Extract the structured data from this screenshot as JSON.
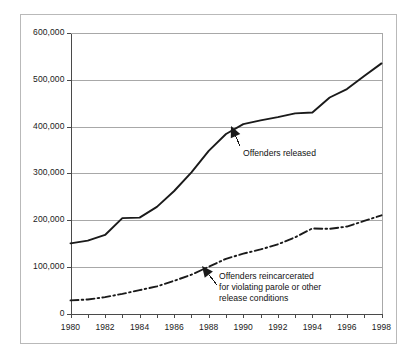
{
  "chart_data": {
    "type": "line",
    "title": "",
    "subtitle": "",
    "xlabel": "",
    "ylabel": "",
    "xlim": [
      1980,
      1998
    ],
    "ylim": [
      0,
      600000
    ],
    "grid": true,
    "grid_axis": "y",
    "legend_position": "inline-annotations",
    "x": [
      1980,
      1981,
      1982,
      1983,
      1984,
      1985,
      1986,
      1987,
      1988,
      1989,
      1990,
      1991,
      1992,
      1993,
      1994,
      1995,
      1996,
      1997,
      1998
    ],
    "ytick_labels": [
      "600,000",
      "500,000",
      "400,000",
      "300,000",
      "200,000",
      "100,000",
      "0"
    ],
    "ytick_values": [
      600000,
      500000,
      400000,
      300000,
      200000,
      100000,
      0
    ],
    "xtick_labels": [
      "1980",
      "1982",
      "1984",
      "1986",
      "1988",
      "1990",
      "1992",
      "1994",
      "1996",
      "1998"
    ],
    "xtick_values": [
      1980,
      1982,
      1984,
      1986,
      1988,
      1990,
      1992,
      1994,
      1996,
      1998
    ],
    "xtick_minor_values": [
      1981,
      1983,
      1985,
      1987,
      1989,
      1991,
      1993,
      1995,
      1997
    ],
    "series": [
      {
        "name": "Offenders released",
        "style": "solid",
        "color": "#1a1a1a",
        "width": 1.9,
        "values": [
          150000,
          156000,
          168000,
          204000,
          205000,
          228000,
          262000,
          302000,
          348000,
          384000,
          405000,
          413000,
          420000,
          428000,
          430000,
          462000,
          480000,
          508000,
          535000
        ]
      },
      {
        "name": "Offenders reincarcerated for violating parole or other release conditions",
        "style": "dash-dot",
        "color": "#1a1a1a",
        "width": 1.9,
        "values": [
          28000,
          30000,
          35000,
          42000,
          50000,
          58000,
          70000,
          83000,
          100000,
          117000,
          128000,
          137000,
          148000,
          163000,
          182000,
          181000,
          186000,
          198000,
          210000
        ]
      }
    ],
    "annotations": [
      {
        "id": "offenders-released-label",
        "lines": [
          "Offenders released"
        ],
        "text_x": 243,
        "text_y": 148,
        "arrow_from": [
          240,
          146
        ],
        "arrow_to": [
          231,
          126
        ]
      },
      {
        "id": "offenders-reincarcerated-label",
        "lines": [
          "Offenders reincarcerated",
          "for violating parole or other",
          "release conditions"
        ],
        "text_x": 219,
        "text_y": 271,
        "arrow_from": [
          217,
          285
        ],
        "arrow_to": [
          202,
          266
        ]
      }
    ],
    "colors": {
      "line": "#1a1a1a",
      "gridline": "#a8a8a8",
      "axis": "#4a4a4a",
      "frame": "#b9b9b9",
      "text": "#1a1a1a",
      "background": "#ffffff"
    }
  }
}
